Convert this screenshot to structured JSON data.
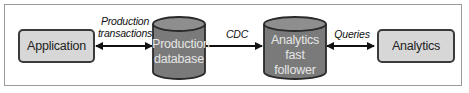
{
  "diagram": {
    "nodes": [
      {
        "id": "application",
        "label": "Application",
        "shape": "rounded-rect"
      },
      {
        "id": "production_database",
        "label_line1": "Production",
        "label_line2": "database",
        "shape": "cylinder"
      },
      {
        "id": "analytics_fast_follower",
        "label_line1": "Analytics",
        "label_line2": "fast",
        "label_line3": "follower",
        "shape": "cylinder"
      },
      {
        "id": "analytics",
        "label": "Analytics",
        "shape": "rounded-rect"
      }
    ],
    "edges": [
      {
        "from": "application",
        "to": "production_database",
        "label_line1": "Production",
        "label_line2": "transactions",
        "direction": "bidirectional"
      },
      {
        "from": "production_database",
        "to": "analytics_fast_follower",
        "label": "CDC",
        "direction": "forward"
      },
      {
        "from": "analytics_fast_follower",
        "to": "analytics",
        "label": "Queries",
        "direction": "bidirectional"
      }
    ],
    "colors": {
      "box_fill": "#d7d7d7",
      "cylinder_fill": "#7a7a7a",
      "cylinder_top": "#8e8e8e",
      "stroke": "#2a2a2a",
      "frame": "#9a9a9a"
    }
  }
}
